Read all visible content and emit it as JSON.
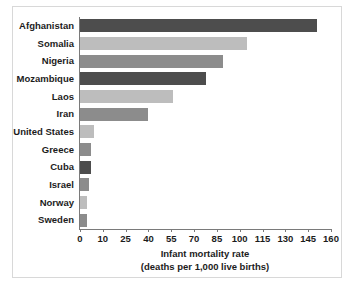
{
  "chart_data": {
    "type": "bar",
    "orientation": "horizontal",
    "title": "",
    "xlabel": "Infant mortality rate",
    "xlabel_sub": "(deaths per 1,000 live births)",
    "ylabel": "",
    "xticks": [
      0,
      10,
      25,
      40,
      55,
      70,
      85,
      100,
      115,
      130,
      145,
      160
    ],
    "xtick_labels": [
      "0",
      "10",
      "25",
      "40",
      "55",
      "70",
      "85",
      "100",
      "115",
      "130",
      "145",
      "160"
    ],
    "xlim": [
      0,
      160
    ],
    "grid": false,
    "legend": "none",
    "categories": [
      "Afghanistan",
      "Somalia",
      "Nigeria",
      "Mozambique",
      "Laos",
      "Iran",
      "United States",
      "Greece",
      "Cuba",
      "Israel",
      "Norway",
      "Sweden"
    ],
    "values": [
      151,
      105,
      89,
      78,
      56,
      40,
      6,
      5,
      5,
      4,
      3,
      3
    ],
    "bar_colors": [
      "#4d4d4d",
      "#bdbdbd",
      "#8c8c8c",
      "#4d4d4d",
      "#bdbdbd",
      "#8c8c8c",
      "#bdbdbd",
      "#8c8c8c",
      "#4d4d4d",
      "#8c8c8c",
      "#bdbdbd",
      "#8c8c8c"
    ]
  },
  "colors": {
    "background": "#ffffff",
    "frame": "#d8d8d8",
    "axis": "#7a7a7a",
    "text": "#1c1c1c",
    "bar_dark": "#4d4d4d",
    "bar_medium": "#8c8c8c",
    "bar_light": "#bdbdbd"
  }
}
